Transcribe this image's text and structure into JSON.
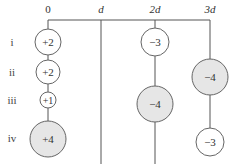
{
  "diagram": {
    "axis_labels": [
      {
        "text": "0",
        "italic": false
      },
      {
        "text": "d",
        "italic": true
      },
      {
        "text": "2d",
        "italic": true
      },
      {
        "text": "3d",
        "italic": true
      }
    ],
    "rows": [
      {
        "label": "i"
      },
      {
        "label": "ii"
      },
      {
        "label": "iii"
      },
      {
        "label": "iv"
      }
    ],
    "charges": [
      {
        "row": "i",
        "position": "0",
        "value": "+2",
        "shaded": false
      },
      {
        "row": "i",
        "position": "2d",
        "value": "−3",
        "shaded": false
      },
      {
        "row": "ii",
        "position": "0",
        "value": "+2",
        "shaded": false
      },
      {
        "row": "ii",
        "position": "3d",
        "value": "−4",
        "shaded": true
      },
      {
        "row": "iii",
        "position": "0",
        "value": "+1",
        "shaded": false
      },
      {
        "row": "iii",
        "position": "2d",
        "value": "−4",
        "shaded": true
      },
      {
        "row": "iv",
        "position": "0",
        "value": "+4",
        "shaded": true
      },
      {
        "row": "iv",
        "position": "3d",
        "value": "−3",
        "shaded": false
      }
    ],
    "colors": {
      "shaded_fill": "#e6e6e6",
      "unshaded_fill": "#ffffff",
      "line": "#555555"
    }
  }
}
